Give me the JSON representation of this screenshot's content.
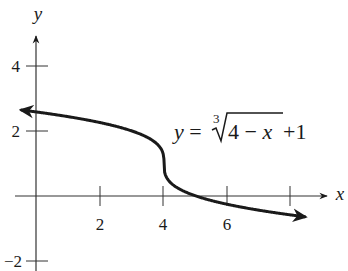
{
  "chart_data": {
    "type": "line",
    "title": "",
    "xlabel": "x",
    "ylabel": "y",
    "x_ticks": [
      2,
      4,
      6,
      8
    ],
    "x_tick_labels": [
      "2",
      "4",
      "6"
    ],
    "y_ticks": [
      4,
      2,
      -2
    ],
    "y_tick_labels": [
      "4",
      "2",
      "−2"
    ],
    "xlim": [
      -0.4,
      9
    ],
    "ylim": [
      -2.2,
      5.2
    ],
    "grid": false,
    "legend": null,
    "annotation": "y = ∛(4 − x) + 1",
    "series": [
      {
        "name": "y = cbrt(4 - x) + 1",
        "function": "cbrt(4 - x) + 1",
        "x_range": [
          -0.45,
          8.4
        ],
        "arrows": "both",
        "points": [
          {
            "x": -0.45,
            "y": 2.65
          },
          {
            "x": 0,
            "y": 2.59
          },
          {
            "x": 2,
            "y": 2.26
          },
          {
            "x": 3,
            "y": 2.0
          },
          {
            "x": 4,
            "y": 1.0
          },
          {
            "x": 5,
            "y": 0.0
          },
          {
            "x": 6,
            "y": -0.26
          },
          {
            "x": 8,
            "y": -0.59
          },
          {
            "x": 8.4,
            "y": -0.64
          }
        ]
      }
    ]
  },
  "labels": {
    "x_axis": "x",
    "y_axis": "y",
    "tick_x2": "2",
    "tick_x4": "4",
    "tick_x6": "6",
    "tick_y4": "4",
    "tick_y2": "2",
    "tick_yneg2": "−2",
    "eq_y": "y",
    "eq_eq": " = ",
    "eq_index": "3",
    "eq_radicand_num": "4 − ",
    "eq_radicand_var": "x",
    "eq_tail": " +1"
  }
}
